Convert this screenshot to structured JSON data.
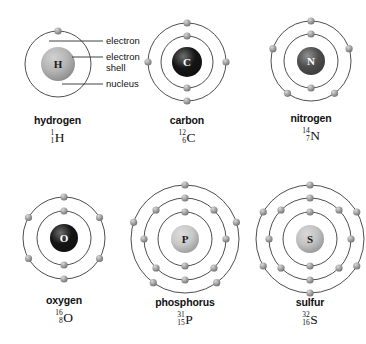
{
  "figure": {
    "background_color": "#ffffff",
    "ring_color": "#3a3a3a",
    "electron_color": "#9a9a9a",
    "atoms": [
      {
        "id": "hydrogen",
        "name": "hydrogen",
        "symbol": "H",
        "mass_number": "1",
        "atomic_number": "1",
        "nucleus_label": "H",
        "nucleus_fill": "#b4b4b4",
        "nucleus_text_color": "#1a1a1a",
        "nucleus_radius": 17,
        "shells": [
          {
            "radius": 33,
            "electrons": 1,
            "start_angle": -90
          }
        ]
      },
      {
        "id": "carbon",
        "name": "carbon",
        "symbol": "C",
        "mass_number": "12",
        "atomic_number": "6",
        "nucleus_label": "C",
        "nucleus_fill": "#151515",
        "nucleus_text_color": "#ffffff",
        "nucleus_radius": 15,
        "shells": [
          {
            "radius": 26,
            "electrons": 2,
            "start_angle": -90
          },
          {
            "radius": 39,
            "electrons": 4,
            "start_angle": -90
          }
        ]
      },
      {
        "id": "nitrogen",
        "name": "nitrogen",
        "symbol": "N",
        "mass_number": "14",
        "atomic_number": "7",
        "nucleus_label": "N",
        "nucleus_fill": "#4d4d4d",
        "nucleus_text_color": "#ffffff",
        "nucleus_radius": 14,
        "shells": [
          {
            "radius": 27,
            "electrons": 2,
            "start_angle": -90
          },
          {
            "radius": 40,
            "electrons": 5,
            "start_angle": -90
          }
        ]
      },
      {
        "id": "oxygen",
        "name": "oxygen",
        "symbol": "O",
        "mass_number": "16",
        "atomic_number": "8",
        "nucleus_label": "O",
        "nucleus_fill": "#141414",
        "nucleus_text_color": "#ffffff",
        "nucleus_radius": 14,
        "shells": [
          {
            "radius": 27,
            "electrons": 2,
            "start_angle": -90
          },
          {
            "radius": 41,
            "electrons": 6,
            "start_angle": -90
          }
        ]
      },
      {
        "id": "phosphorus",
        "name": "phosphorus",
        "symbol": "P",
        "mass_number": "31",
        "atomic_number": "15",
        "nucleus_label": "P",
        "nucleus_fill": "#c8c8c8",
        "nucleus_text_color": "#1a1a1a",
        "nucleus_radius": 14,
        "shells": [
          {
            "radius": 27,
            "electrons": 2,
            "start_angle": -90
          },
          {
            "radius": 41,
            "electrons": 8,
            "start_angle": -90
          },
          {
            "radius": 54,
            "electrons": 5,
            "start_angle": -90
          }
        ]
      },
      {
        "id": "sulfur",
        "name": "sulfur",
        "symbol": "S",
        "mass_number": "32",
        "atomic_number": "16",
        "nucleus_label": "S",
        "nucleus_fill": "#c2c2c2",
        "nucleus_text_color": "#1a1a1a",
        "nucleus_radius": 14,
        "shells": [
          {
            "radius": 27,
            "electrons": 2,
            "start_angle": -90
          },
          {
            "radius": 41,
            "electrons": 8,
            "start_angle": -90
          },
          {
            "radius": 54,
            "electrons": 6,
            "start_angle": -90
          }
        ]
      }
    ],
    "annotations": [
      {
        "id": "electron",
        "label": "electron"
      },
      {
        "id": "electron-shell-line1",
        "label": "electron"
      },
      {
        "id": "electron-shell-line2",
        "label": "shell"
      },
      {
        "id": "nucleus",
        "label": "nucleus"
      }
    ]
  }
}
